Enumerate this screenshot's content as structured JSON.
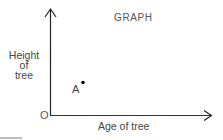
{
  "diagram": {
    "title": "GRAPH",
    "y_axis": {
      "label_lines": [
        "Height",
        "of",
        "tree"
      ]
    },
    "x_axis": {
      "label": "Age of tree"
    },
    "origin_label": "O",
    "points": [
      {
        "label": "A",
        "x_px": 82,
        "y_px": 82
      }
    ],
    "colors": {
      "axis": "#222222",
      "text": "#444444",
      "background": "#ffffff"
    }
  }
}
